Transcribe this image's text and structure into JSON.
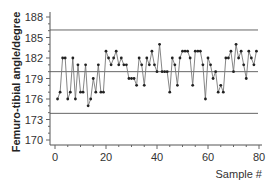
{
  "chart_data": {
    "type": "line",
    "title": "",
    "xlabel": "Sample #",
    "ylabel": "Femuro-tibial angle/degree",
    "xlim": [
      -2,
      82
    ],
    "ylim": [
      169.5,
      189
    ],
    "x_ticks": [
      0,
      20,
      40,
      60,
      80
    ],
    "y_ticks": [
      170,
      173,
      176,
      179,
      182,
      185,
      188
    ],
    "x_tick_labels": [
      "0",
      "20",
      "40",
      "60",
      "80"
    ],
    "y_tick_labels": [
      "170",
      "173",
      "176",
      "179",
      "182",
      "185",
      "188"
    ],
    "grid": false,
    "legend": null,
    "reference_lines": [
      {
        "name": "upper-control-limit",
        "y": 186.1
      },
      {
        "name": "center-line",
        "y": 180.0
      },
      {
        "name": "lower-control-limit",
        "y": 173.9
      }
    ],
    "series": [
      {
        "name": "Femuro-tibial angle",
        "marker": "circle",
        "color": "#555555",
        "x": [
          1,
          2,
          3,
          4,
          5,
          6,
          7,
          8,
          9,
          10,
          11,
          12,
          13,
          14,
          15,
          16,
          17,
          18,
          19,
          20,
          21,
          22,
          23,
          24,
          25,
          26,
          27,
          28,
          29,
          30,
          31,
          32,
          33,
          34,
          35,
          36,
          37,
          38,
          39,
          40,
          41,
          42,
          43,
          44,
          45,
          46,
          47,
          48,
          49,
          50,
          51,
          52,
          53,
          54,
          55,
          56,
          57,
          58,
          59,
          60,
          61,
          62,
          63,
          64,
          65,
          66,
          67,
          68,
          69,
          70,
          71,
          72,
          73,
          74,
          75,
          76,
          77,
          78,
          79
        ],
        "values": [
          176,
          177,
          182,
          182,
          176,
          177,
          182,
          176,
          181,
          177,
          177,
          181,
          175,
          176,
          179,
          177,
          181,
          177,
          177,
          183,
          182,
          181,
          182,
          183,
          181,
          182,
          181,
          181,
          179,
          179,
          179,
          178,
          182,
          181,
          178,
          182,
          181,
          183,
          181,
          180,
          184,
          180,
          180,
          180,
          177,
          182,
          181,
          178,
          182,
          183,
          183,
          183,
          182,
          178,
          183,
          183,
          183,
          181,
          176,
          182,
          181,
          179,
          180,
          177,
          178,
          177,
          182,
          182,
          183,
          180,
          184,
          182,
          183,
          181,
          179,
          183,
          182,
          181,
          183
        ]
      }
    ]
  }
}
